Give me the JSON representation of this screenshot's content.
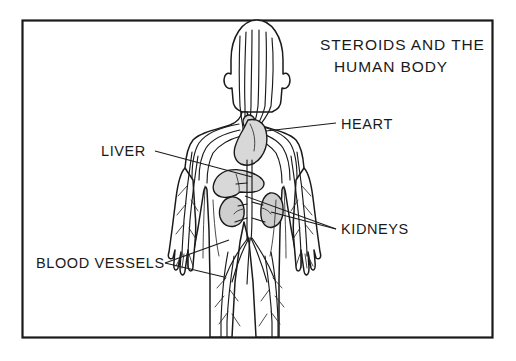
{
  "figure": {
    "title_line_1": "STEROIDS AND THE",
    "title_line_2": "HUMAN BODY",
    "frame": {
      "stroke_color": "#1a1a1a",
      "background_color": "#ffffff"
    },
    "labels": [
      {
        "id": "heart",
        "text": "HEART",
        "text_x": 341,
        "text_y": 129,
        "anchor": "start",
        "leader": "M 336 123 L 266 131"
      },
      {
        "id": "liver",
        "text": "LIVER",
        "text_x": 101,
        "text_y": 156,
        "anchor": "start",
        "leader": "M 155 151 L 252 177"
      },
      {
        "id": "kidneys",
        "text": "KIDNEYS",
        "text_x": 341,
        "text_y": 234,
        "anchor": "start",
        "leader_1": "M 336 229 L 245 196",
        "leader_2": "M 336 229 L 271 210"
      },
      {
        "id": "blood-vessels",
        "text": "BLOOD VESSELS",
        "text_x": 36,
        "text_y": 268,
        "anchor": "start",
        "leader_1": "M 165 263 L 222 275",
        "leader_2": "M 165 263 L 229 240"
      }
    ],
    "organs": [
      {
        "id": "heart",
        "name": "heart",
        "fill": "#d8d8d8"
      },
      {
        "id": "liver",
        "name": "liver",
        "fill": "#d8d8d8"
      },
      {
        "id": "kidney-left",
        "name": "kidney",
        "fill": "#cfcfcf"
      },
      {
        "id": "kidney-right",
        "name": "kidney",
        "fill": "#cfcfcf"
      }
    ]
  }
}
